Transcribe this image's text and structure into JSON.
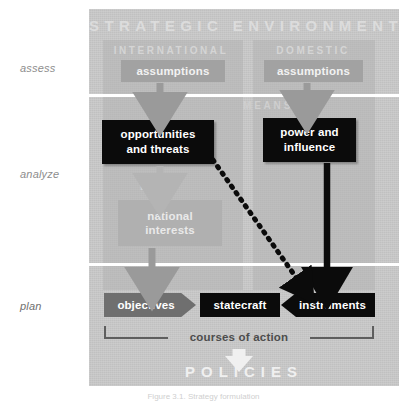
{
  "figure": {
    "title": "STRATEGIC ENVIRONMENT",
    "caption": "Figure 3.1. Strategy formulation",
    "width": 407,
    "height": 405
  },
  "stages": [
    {
      "id": "assess",
      "label": "assess"
    },
    {
      "id": "analyze",
      "label": "analyze"
    },
    {
      "id": "plan",
      "label": "plan"
    }
  ],
  "columns": {
    "international": "INTERNATIONAL",
    "domestic": "DOMESTIC"
  },
  "section_headers": {
    "means": "MEANS",
    "ends": "ENDS"
  },
  "nodes": {
    "assumptions_international": "assumptions",
    "assumptions_domestic": "assumptions",
    "opportunities_and_threats": "opportunities\nand threats",
    "opportunities_line1": "opportunities",
    "opportunities_line2": "and threats",
    "power_line1": "power and",
    "power_line2": "influence",
    "national_line1": "national",
    "national_line2": "interests",
    "objectives": "objectives",
    "statecraft": "statecraft",
    "instruments": "instruments"
  },
  "bracket": {
    "label": "courses of action"
  },
  "output": {
    "label": "POLICIES"
  },
  "colors": {
    "panel_background": "#c9c9c9",
    "page_background": "#ffffff",
    "black_box": "#0b0b0b",
    "gray_box": "#a2a2a2",
    "objectives_gray": "#6f6f6f",
    "faint_header": "#d5d5d5",
    "stage_label": "#8d8d8d",
    "bracket_line": "#5e5e5e",
    "policies_text": "#f0f0f0",
    "arrow_gray": "#9a9a9a",
    "arrow_black": "#0b0b0b"
  },
  "connectors": [
    {
      "id": "assumptions-intl-to-opportunities",
      "style": "solid-gray-arrow",
      "direction": "down"
    },
    {
      "id": "assumptions-dom-to-power",
      "style": "solid-gray-arrow",
      "direction": "down"
    },
    {
      "id": "opportunities-to-national",
      "style": "solid-gray-arrow",
      "direction": "down"
    },
    {
      "id": "national-to-objectives",
      "style": "solid-gray-arrow",
      "direction": "down"
    },
    {
      "id": "power-to-instruments",
      "style": "solid-black-arrow",
      "direction": "down"
    },
    {
      "id": "opportunities-to-instruments",
      "style": "dotted-black-arrow",
      "direction": "diagonal-down-right"
    },
    {
      "id": "coa-to-policies",
      "style": "solid-white-arrow",
      "direction": "down"
    }
  ]
}
